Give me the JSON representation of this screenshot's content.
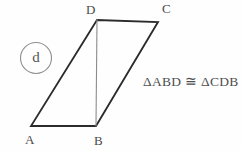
{
  "figure": {
    "item_label": "d",
    "congruence_statement": "ΔABD ≅ ΔCDB",
    "background_color": "#fefefe",
    "outline_color": "#2b2b2b",
    "diagonal_color": "#8c8c8c",
    "label_color": "#4a4a4a",
    "shape": "parallelogram",
    "vertices": [
      {
        "name": "A",
        "x": 31,
        "y": 126,
        "label_x": 25,
        "label_y": 133
      },
      {
        "name": "B",
        "x": 96,
        "y": 126,
        "label_x": 94,
        "label_y": 134
      },
      {
        "name": "C",
        "x": 158,
        "y": 22,
        "label_x": 162,
        "label_y": 2
      },
      {
        "name": "D",
        "x": 97,
        "y": 20,
        "label_x": 86,
        "label_y": 3
      }
    ],
    "edges": [
      {
        "name": "AB",
        "from": "A",
        "to": "B"
      },
      {
        "name": "BC",
        "from": "B",
        "to": "C"
      },
      {
        "name": "CD",
        "from": "C",
        "to": "D"
      },
      {
        "name": "DA",
        "from": "D",
        "to": "A"
      }
    ],
    "diagonal": {
      "name": "DB",
      "from": "D",
      "to": "B"
    },
    "labels": {
      "A": "A",
      "B": "B",
      "C": "C",
      "D": "D"
    }
  }
}
